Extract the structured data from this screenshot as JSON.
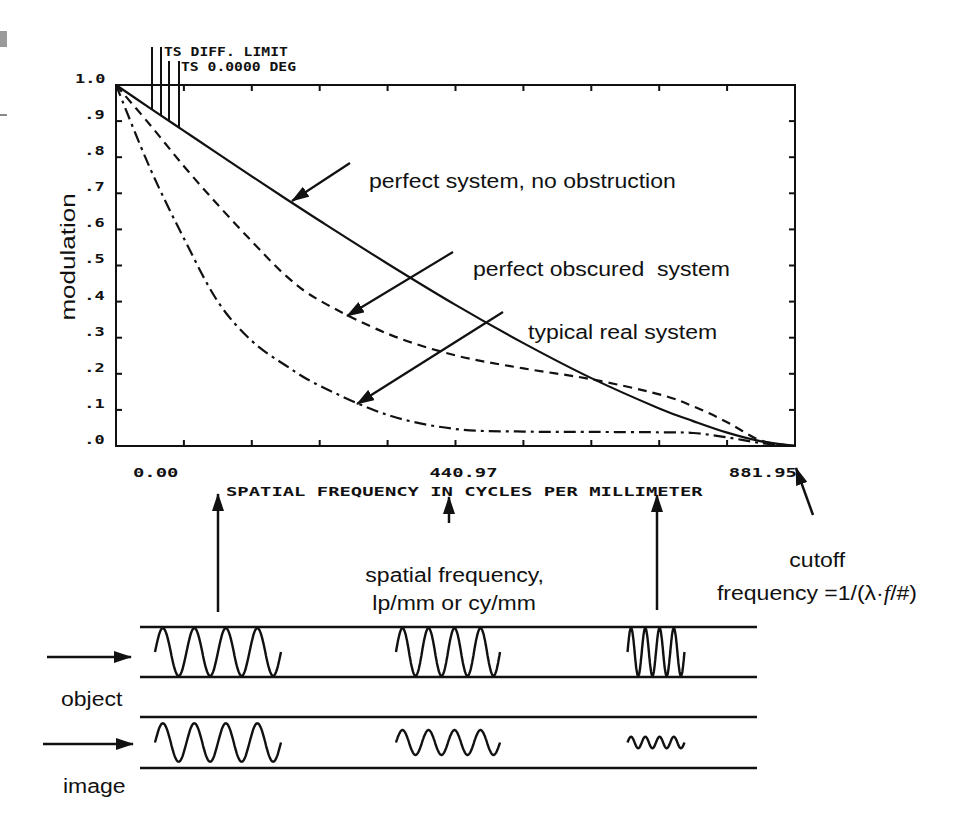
{
  "figure": {
    "top_labels": [
      "TS DIFF. LIMIT",
      "TS 0.0000 DEG"
    ],
    "y_axis": {
      "label": "modulation",
      "ticks": [
        "1.0",
        ".9",
        ".8",
        ".7",
        ".6",
        ".5",
        ".4",
        ".3",
        ".2",
        ".1",
        ".0"
      ]
    },
    "x_axis": {
      "title": "SPATIAL FREQUENCY IN CYCLES PER MILLIMETER",
      "tick_min": "0.00",
      "tick_mid": "440.97",
      "tick_max": "881.95"
    },
    "annotations": {
      "perfect": "perfect system, no obstruction",
      "obscured": "perfect obscured  system",
      "typical": "typical real system",
      "spatial_freq_line1": "spatial frequency,",
      "spatial_freq_line2": "lp/mm or cy/mm",
      "cutoff_line1": "cutoff",
      "cutoff_formula": {
        "prefix": "frequency =1/(λ·",
        "italic": "f",
        "suffix": "/#)"
      }
    },
    "diagram": {
      "object_label": "object",
      "image_label": "image",
      "patterns": [
        {
          "name": "low-frequency",
          "cycles": 4,
          "object_modulation": 1.0,
          "image_modulation": 0.8
        },
        {
          "name": "medium-frequency",
          "cycles": 4,
          "object_modulation": 1.0,
          "image_modulation": 0.52
        },
        {
          "name": "high-frequency",
          "cycles": 4,
          "object_modulation": 1.0,
          "image_modulation": 0.24
        }
      ]
    }
  },
  "colors": {
    "ink": "#111111",
    "background": "#ffffff",
    "scan_mark": "#9a9a9a"
  },
  "chart_data": {
    "type": "line",
    "title": "",
    "xlabel": "SPATIAL FREQUENCY IN CYCLES PER MILLIMETER",
    "ylabel": "modulation",
    "xlim": [
      0,
      881.95
    ],
    "ylim": [
      0,
      1.0
    ],
    "x_tick_labels": [
      "0.00",
      "440.97",
      "881.95"
    ],
    "y_tick_labels": [
      "1.0",
      ".9",
      ".8",
      ".7",
      ".6",
      ".5",
      ".4",
      ".3",
      ".2",
      ".1",
      ".0"
    ],
    "grid": false,
    "legend": "none (curves labeled by arrow annotations)",
    "x": [
      0,
      44.1,
      88.2,
      132.3,
      176.4,
      220.5,
      264.6,
      352.8,
      441.0,
      529.2,
      617.4,
      705.6,
      749.7,
      793.8,
      837.9,
      881.95
    ],
    "series": [
      {
        "name": "perfect system, no obstruction",
        "style": "solid",
        "values": [
          1.0,
          0.936,
          0.873,
          0.81,
          0.747,
          0.685,
          0.624,
          0.505,
          0.391,
          0.285,
          0.188,
          0.104,
          0.069,
          0.037,
          0.013,
          0.0
        ]
      },
      {
        "name": "perfect obscured system",
        "style": "dashed",
        "values": [
          1.0,
          0.89,
          0.775,
          0.668,
          0.567,
          0.472,
          0.403,
          0.311,
          0.251,
          0.215,
          0.185,
          0.143,
          0.11,
          0.066,
          0.015,
          0.0
        ]
      },
      {
        "name": "typical real system",
        "style": "dash-dot",
        "values": [
          1.0,
          0.77,
          0.575,
          0.4,
          0.291,
          0.223,
          0.167,
          0.086,
          0.047,
          0.04,
          0.039,
          0.038,
          0.036,
          0.024,
          0.008,
          0.0
        ]
      }
    ],
    "annotations": [
      "TS DIFF. LIMIT",
      "TS 0.0000 DEG",
      "cutoff frequency =1/(λ·f/#)",
      "spatial frequency, lp/mm or cy/mm"
    ]
  }
}
